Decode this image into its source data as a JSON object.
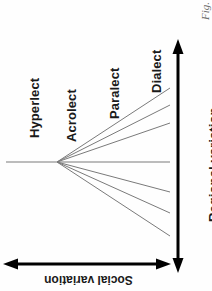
{
  "figure": {
    "caption": "Fig.",
    "orientation_note": "rotated-diagram"
  },
  "axes": {
    "vertical": {
      "label": "Regional variation",
      "arrow": "double-headed-vertical-arrow",
      "color": "#000000"
    },
    "horizontal": {
      "label": "Social variation",
      "arrow": "double-headed-horizontal-arrow",
      "color": "#000000"
    }
  },
  "labels": {
    "hyperlect": "Hyperlect",
    "acrolect": "Acrolect",
    "paralect": "Paralect",
    "dialect": "Dialect"
  },
  "chart_data": {
    "type": "line",
    "title": "",
    "subtitle": "",
    "xlabel": "Social variation",
    "ylabel": "Regional variation",
    "legend_position": "none",
    "grid": false,
    "annotations": [
      "Hyperlect",
      "Acrolect",
      "Paralect",
      "Dialect"
    ],
    "origin": {
      "x": 57,
      "y": 162
    },
    "stem": {
      "x0": 6,
      "y0": 162,
      "x1": 57,
      "y1": 162
    },
    "series": [
      {
        "name": "stem-left",
        "x": [
          6,
          57
        ],
        "y": [
          162,
          162
        ]
      },
      {
        "name": "branch-up-3",
        "x": [
          57,
          170
        ],
        "y": [
          162,
          88
        ]
      },
      {
        "name": "branch-up-2",
        "x": [
          57,
          170
        ],
        "y": [
          162,
          105
        ]
      },
      {
        "name": "branch-up-1",
        "x": [
          57,
          170
        ],
        "y": [
          162,
          123
        ]
      },
      {
        "name": "branch-mid",
        "x": [
          57,
          170
        ],
        "y": [
          162,
          162
        ]
      },
      {
        "name": "branch-dn-1",
        "x": [
          57,
          170
        ],
        "y": [
          162,
          192
        ]
      },
      {
        "name": "branch-dn-2",
        "x": [
          57,
          170
        ],
        "y": [
          162,
          213
        ]
      },
      {
        "name": "branch-dn-3",
        "x": [
          57,
          170
        ],
        "y": [
          162,
          236
        ]
      }
    ],
    "line_color": "#7a7a7a",
    "axis_color": "#000000",
    "xlim": [
      0,
      212
    ],
    "ylim": [
      0,
      291
    ]
  }
}
